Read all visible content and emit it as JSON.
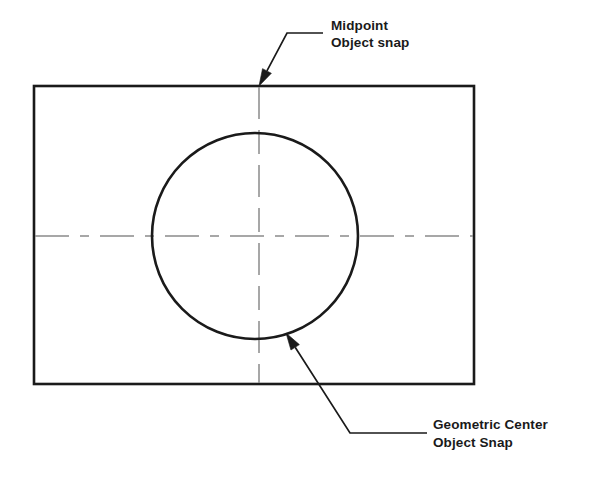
{
  "figure": {
    "background_color": "#ffffff",
    "outline_color": "#1a1a1a",
    "centerline_color": "#8a8a8a",
    "leader_color": "#1a1a1a"
  },
  "shapes": {
    "rectangle": {
      "name": "outer rectangle",
      "x": 34,
      "y": 86,
      "width": 440,
      "height": 298,
      "stroke_width": 2.6
    },
    "circle": {
      "name": "inner circle",
      "cx": 255,
      "cy": 236,
      "r": 103,
      "stroke_width": 2.6
    },
    "centerline_horizontal": {
      "name": "horizontal centerline",
      "x1": 35,
      "y1": 236,
      "x2": 473,
      "y2": 236,
      "dash": "34 11 9 11"
    },
    "centerline_vertical": {
      "name": "vertical centerline",
      "x1": 259,
      "y1": 87,
      "x2": 259,
      "y2": 383,
      "dash": "32 11 24 11"
    }
  },
  "callouts": [
    {
      "id": "midpoint",
      "line1": "Midpoint",
      "line2": "Object snap",
      "text_x": 331,
      "text_y1": 30,
      "text_y2": 47,
      "leader": {
        "arrow_tip_x": 259,
        "arrow_tip_y": 86,
        "elbow_x": 287,
        "elbow_y": 33,
        "end_x": 323,
        "end_y": 33
      }
    },
    {
      "id": "geometric-center",
      "line1": "Geometric Center",
      "line2": "Object Snap",
      "text_x": 433,
      "text_y1": 429,
      "text_y2": 447,
      "leader": {
        "arrow_tip_x": 286,
        "arrow_tip_y": 333,
        "elbow_x": 350,
        "elbow_y": 433,
        "end_x": 427,
        "end_y": 433
      }
    }
  ]
}
